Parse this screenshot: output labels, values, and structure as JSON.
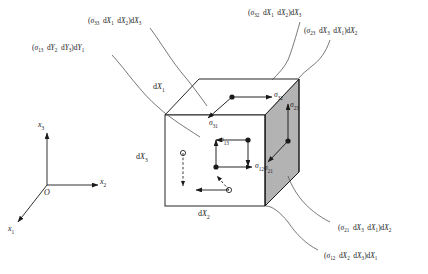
{
  "figure": {
    "background": "#ffffff",
    "line_color": "#1a1a1a",
    "shaded_face_color": "#b3b3b3",
    "dashed_color": "#8c8c8c"
  },
  "axes": {
    "origin_label": "O",
    "x1": {
      "symbol": "x",
      "sub": "1"
    },
    "x2": {
      "symbol": "x",
      "sub": "2"
    },
    "x3": {
      "symbol": "x",
      "sub": "3"
    }
  },
  "edge_labels": [
    {
      "name": "dX1",
      "prefix": "d",
      "symbol": "X",
      "sub": "1"
    },
    {
      "name": "dX2",
      "prefix": "d",
      "symbol": "X",
      "sub": "2"
    },
    {
      "name": "dX3",
      "prefix": "d",
      "symbol": "X",
      "sub": "3"
    }
  ],
  "stress_components": [
    {
      "name": "sigma-32",
      "symbol": "σ",
      "sub": "32"
    },
    {
      "name": "sigma-31",
      "symbol": "σ",
      "sub": "31"
    },
    {
      "name": "sigma-23",
      "symbol": "σ",
      "sub": "23"
    },
    {
      "name": "sigma-21",
      "symbol": "σ",
      "sub": "21"
    },
    {
      "name": "sigma-13",
      "symbol": "σ",
      "sub": "13"
    },
    {
      "name": "sigma-12",
      "symbol": "σ",
      "sub": "12"
    }
  ],
  "callouts": [
    {
      "name": "callout-sigma13",
      "text": "(σ₁₃ dY₂ dY₃)dY₁",
      "parts": {
        "sigma_sub": "13",
        "f1": "Y",
        "f1s": "2",
        "f2": "Y",
        "f2s": "3",
        "f3": "Y",
        "f3s": "1"
      }
    },
    {
      "name": "callout-sigma33",
      "text": "(σ₃₃ dX₁ dX₂)dX₃",
      "parts": {
        "sigma_sub": "33",
        "f1": "X",
        "f1s": "1",
        "f2": "X",
        "f2s": "2",
        "f3": "X",
        "f3s": "3"
      }
    },
    {
      "name": "callout-sigma32-top",
      "text": "(σ₃₂ dX₁ dX₂)dX₃",
      "parts": {
        "sigma_sub": "32",
        "f1": "X",
        "f1s": "1",
        "f2": "X",
        "f2s": "2",
        "f3": "X",
        "f3s": "3"
      }
    },
    {
      "name": "callout-sigma23",
      "text": "(σ₂₃ dX₃ dX₁)dX₂",
      "parts": {
        "sigma_sub": "23",
        "f1": "X",
        "f1s": "3",
        "f2": "X",
        "f2s": "1",
        "f3": "X",
        "f3s": "2"
      }
    },
    {
      "name": "callout-sigma21",
      "text": "(σ₂₁ dX₃ dX₁)dX₂",
      "parts": {
        "sigma_sub": "21",
        "f1": "X",
        "f1s": "3",
        "f2": "X",
        "f2s": "1",
        "f3": "X",
        "f3s": "2"
      }
    },
    {
      "name": "callout-sigma12-bottom",
      "text": "(σ₁₂ dX₂ dX₃)dX₁",
      "parts": {
        "sigma_sub": "12",
        "f1": "X",
        "f1s": "2",
        "f2": "X",
        "f2s": "3",
        "f3": "X",
        "f3s": "1"
      }
    }
  ]
}
